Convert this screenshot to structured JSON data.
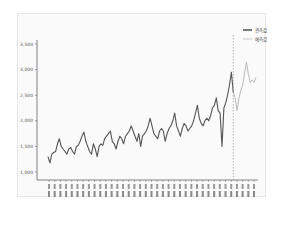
{
  "chart_data": {
    "type": "line",
    "title": "",
    "xlabel": "",
    "ylabel": "",
    "ylim": [
      1000,
      3500
    ],
    "yticks": [
      1000,
      1500,
      2000,
      2500,
      3000,
      3500
    ],
    "ytick_labels": [
      "1,000",
      "1,500",
      "2,000",
      "2,500",
      "3,000",
      "3,500"
    ],
    "grid": false,
    "legend_position": "upper right",
    "forecast_start_index": 98,
    "series": [
      {
        "name": "관측값",
        "color": "#555555",
        "style": "solid",
        "values": [
          1300,
          1180,
          1350,
          1380,
          1400,
          1550,
          1650,
          1500,
          1450,
          1400,
          1350,
          1450,
          1480,
          1400,
          1350,
          1500,
          1520,
          1600,
          1700,
          1780,
          1600,
          1500,
          1400,
          1350,
          1550,
          1450,
          1300,
          1500,
          1550,
          1520,
          1650,
          1700,
          1750,
          1800,
          1600,
          1550,
          1450,
          1600,
          1700,
          1650,
          1550,
          1700,
          1750,
          1800,
          1900,
          1800,
          1700,
          1600,
          1750,
          1500,
          1700,
          1750,
          1800,
          1900,
          2050,
          1900,
          1750,
          1700,
          1650,
          1800,
          1850,
          1800,
          1600,
          1750,
          1850,
          1900,
          2000,
          2150,
          1900,
          1800,
          1700,
          1850,
          1950,
          1900,
          1800,
          1850,
          1900,
          2000,
          2150,
          2300,
          2050,
          1950,
          1900,
          2000,
          2050,
          2000,
          2100,
          2250,
          2300,
          2450,
          2200,
          2150,
          1500,
          2250,
          2350,
          2500,
          2700,
          2950,
          2550
        ],
        "note": "Observed series, approximate monthly values read from the plot"
      },
      {
        "name": "예측값",
        "color": "#bbbbbb",
        "style": "solid",
        "values": [
          2550,
          2450,
          2200,
          2450,
          2600,
          2700,
          2950,
          3150,
          2900,
          2750,
          2800,
          2750,
          2850
        ],
        "note": "Forecast series following the dashed divider"
      }
    ],
    "divider": {
      "style": "dashed",
      "color": "#999999",
      "at_index": 98
    },
    "x_tick_count": 37,
    "x_tick_labels_note": "Rotated date labels along the x-axis (illegible at source resolution)"
  },
  "legend": {
    "items": [
      {
        "label": "관측값",
        "color": "#444444"
      },
      {
        "label": "예측값",
        "color": "#bbbbbb"
      }
    ]
  }
}
